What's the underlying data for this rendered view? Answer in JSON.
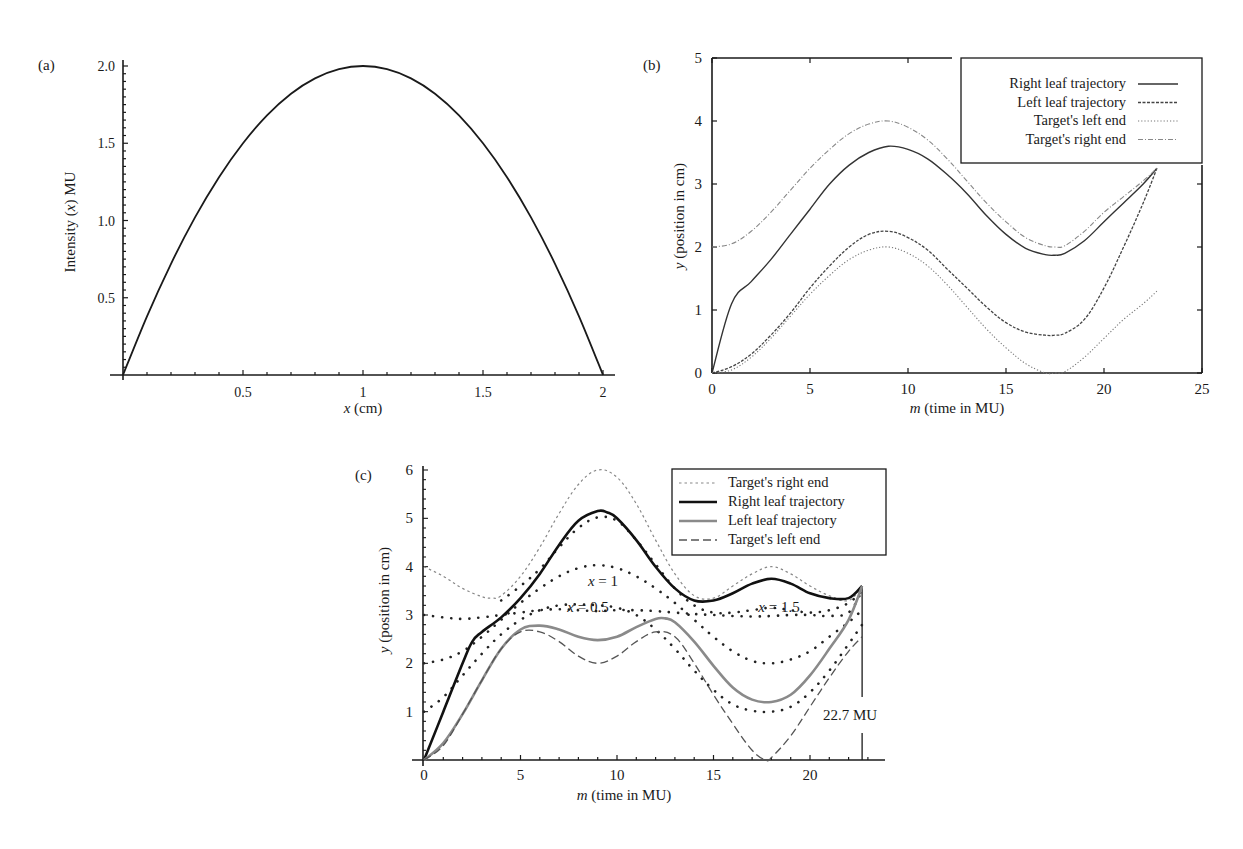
{
  "figure": {
    "panels": [
      "(a)",
      "(b)",
      "(c)"
    ]
  },
  "chart_data": [
    {
      "id": "a",
      "panel_label": "(a)",
      "type": "line",
      "title": "",
      "xlabel": "x (cm)",
      "ylabel": "Intensity (x) MU",
      "xlim": [
        0,
        2
      ],
      "ylim": [
        0,
        2.0
      ],
      "xticks": [
        0.5,
        1,
        1.5,
        2
      ],
      "xtick_labels": [
        "0.5",
        "1",
        "1.5",
        "2"
      ],
      "yticks": [
        0.5,
        1.0,
        1.5,
        2.0
      ],
      "ytick_labels": [
        "0.5",
        "1.0",
        "1.5",
        "2.0"
      ],
      "grid": false,
      "legend": null,
      "series": [
        {
          "name": "Intensity profile",
          "style": "solid",
          "x": [
            0,
            0.1,
            0.2,
            0.3,
            0.4,
            0.5,
            0.6,
            0.7,
            0.8,
            0.9,
            1.0,
            1.1,
            1.2,
            1.3,
            1.4,
            1.5,
            1.6,
            1.7,
            1.8,
            1.9,
            2.0
          ],
          "y": [
            0,
            0.38,
            0.72,
            1.02,
            1.28,
            1.5,
            1.68,
            1.82,
            1.92,
            1.98,
            2.0,
            1.98,
            1.92,
            1.82,
            1.68,
            1.5,
            1.28,
            1.02,
            0.72,
            0.38,
            0
          ]
        }
      ]
    },
    {
      "id": "b",
      "panel_label": "(b)",
      "type": "line",
      "title": "",
      "xlabel": "m (time in MU)",
      "ylabel": "y (position in cm)",
      "xlim": [
        0,
        25
      ],
      "ylim": [
        0,
        5
      ],
      "xticks": [
        0,
        5,
        10,
        15,
        20,
        25
      ],
      "xtick_labels": [
        "0",
        "5",
        "10",
        "15",
        "20",
        "25"
      ],
      "yticks": [
        0,
        1,
        2,
        3,
        4,
        5
      ],
      "ytick_labels": [
        "0",
        "1",
        "2",
        "3",
        "4",
        "5"
      ],
      "grid": false,
      "legend_position": "upper right",
      "series": [
        {
          "name": "Right leaf trajectory",
          "style": "solid",
          "x": [
            0,
            1.0,
            2.0,
            3.0,
            4.0,
            5.0,
            6.0,
            7.0,
            8.0,
            9.0,
            10.0,
            11.0,
            12.0,
            13.0,
            14.0,
            15.0,
            16.0,
            17.0,
            17.5,
            18.0,
            19.0,
            20.0,
            21.0,
            22.0,
            22.7
          ],
          "y": [
            0,
            1.1,
            1.45,
            1.8,
            2.2,
            2.6,
            3.0,
            3.3,
            3.5,
            3.6,
            3.55,
            3.4,
            3.15,
            2.85,
            2.5,
            2.2,
            1.98,
            1.88,
            1.87,
            1.9,
            2.1,
            2.4,
            2.7,
            3.0,
            3.25
          ]
        },
        {
          "name": "Left leaf trajectory",
          "style": "dashed",
          "x": [
            0,
            1.0,
            2.0,
            3.0,
            4.0,
            5.0,
            6.0,
            7.0,
            8.0,
            9.0,
            10.0,
            11.0,
            12.0,
            13.0,
            14.0,
            15.0,
            16.0,
            17.0,
            17.5,
            18.0,
            19.0,
            20.0,
            21.0,
            22.0,
            22.7
          ],
          "y": [
            0,
            0.1,
            0.3,
            0.6,
            0.95,
            1.35,
            1.7,
            2.0,
            2.2,
            2.25,
            2.15,
            1.95,
            1.65,
            1.35,
            1.05,
            0.8,
            0.65,
            0.6,
            0.6,
            0.63,
            0.85,
            1.35,
            2.0,
            2.7,
            3.25
          ]
        },
        {
          "name": "Target's left end",
          "style": "dotted",
          "x": [
            0,
            1.0,
            2.0,
            3.0,
            4.0,
            5.0,
            6.0,
            7.0,
            8.0,
            9.0,
            10.0,
            11.0,
            12.0,
            13.0,
            14.0,
            15.0,
            16.0,
            17.0,
            17.5,
            18.0,
            19.0,
            20.0,
            21.0,
            22.0,
            22.7
          ],
          "y": [
            0,
            0.05,
            0.25,
            0.55,
            0.9,
            1.25,
            1.55,
            1.8,
            1.95,
            2.0,
            1.9,
            1.7,
            1.4,
            1.05,
            0.7,
            0.4,
            0.15,
            0.0,
            0.0,
            0.02,
            0.25,
            0.55,
            0.85,
            1.1,
            1.3
          ]
        },
        {
          "name": "Target's right end",
          "style": "dash-dot",
          "x": [
            0,
            1.0,
            2.0,
            3.0,
            4.0,
            5.0,
            6.0,
            7.0,
            8.0,
            9.0,
            10.0,
            11.0,
            12.0,
            13.0,
            14.0,
            15.0,
            16.0,
            17.0,
            17.5,
            18.0,
            19.0,
            20.0,
            21.0,
            22.0,
            22.7
          ],
          "y": [
            2.0,
            2.05,
            2.25,
            2.55,
            2.9,
            3.25,
            3.55,
            3.8,
            3.95,
            4.0,
            3.9,
            3.7,
            3.4,
            3.05,
            2.7,
            2.4,
            2.15,
            2.02,
            2.0,
            2.02,
            2.25,
            2.55,
            2.8,
            3.05,
            3.25
          ]
        }
      ]
    },
    {
      "id": "c",
      "panel_label": "(c)",
      "type": "line",
      "title": "",
      "xlabel": "m (time in MU)",
      "ylabel": "y (position in cm)",
      "xlim": [
        0,
        23.5
      ],
      "ylim": [
        0,
        6
      ],
      "xticks": [
        0,
        5,
        10,
        15,
        20
      ],
      "xtick_labels": [
        "0",
        "5",
        "10",
        "15",
        "20"
      ],
      "yticks": [
        1,
        2,
        3,
        4,
        5,
        6
      ],
      "ytick_labels": [
        "1",
        "2",
        "3",
        "4",
        "5",
        "6"
      ],
      "grid": false,
      "legend_position": "upper right",
      "annotations": [
        {
          "text": "x = 1",
          "x": 9.0,
          "y": 4.35
        },
        {
          "text": "x = 0.5",
          "x": 9.0,
          "y": 3.2
        },
        {
          "text": "x = 1.5",
          "x": 16.8,
          "y": 3.2
        },
        {
          "text": "22.7 MU",
          "x": 22.7,
          "y": 1.0
        }
      ],
      "marker_line": {
        "x": 22.7,
        "y_from": 0,
        "y_to": 3.6
      },
      "series": [
        {
          "name": "Target's right end",
          "style": "dotted-thin-gray",
          "x": [
            0,
            1,
            2,
            3,
            3.5,
            4,
            5,
            6,
            7,
            8,
            9,
            10,
            11,
            12,
            13,
            14,
            15,
            16,
            17,
            18,
            19,
            20,
            21,
            22,
            22.7
          ],
          "y": [
            4.0,
            3.8,
            3.55,
            3.38,
            3.35,
            3.4,
            3.8,
            4.4,
            5.1,
            5.7,
            6.0,
            5.85,
            5.3,
            4.55,
            3.85,
            3.4,
            3.35,
            3.6,
            3.85,
            4.0,
            3.85,
            3.6,
            3.4,
            3.3,
            3.6
          ]
        },
        {
          "name": "Right leaf trajectory",
          "style": "solid-thick-black",
          "x": [
            0,
            1,
            2,
            2.5,
            3,
            4,
            5,
            6,
            7,
            8,
            9,
            9.5,
            10,
            11,
            12,
            13,
            14,
            15,
            16,
            17,
            18,
            19,
            20,
            21,
            22,
            22.7
          ],
          "y": [
            0,
            1.0,
            2.0,
            2.45,
            2.65,
            2.95,
            3.35,
            3.85,
            4.45,
            4.95,
            5.15,
            5.12,
            5.0,
            4.55,
            4.0,
            3.55,
            3.3,
            3.3,
            3.45,
            3.65,
            3.75,
            3.65,
            3.45,
            3.35,
            3.35,
            3.6
          ]
        },
        {
          "name": "Left leaf trajectory",
          "style": "solid-thick-gray",
          "x": [
            0,
            1,
            2,
            3,
            4,
            5,
            6,
            7,
            8,
            9,
            10,
            11,
            12,
            12.5,
            13,
            14,
            15,
            16,
            17,
            18,
            19,
            20,
            21,
            22,
            22.7
          ],
          "y": [
            0,
            0.35,
            0.95,
            1.65,
            2.3,
            2.7,
            2.78,
            2.7,
            2.55,
            2.48,
            2.55,
            2.75,
            2.92,
            2.93,
            2.85,
            2.45,
            1.95,
            1.5,
            1.25,
            1.2,
            1.35,
            1.75,
            2.3,
            2.9,
            3.6
          ]
        },
        {
          "name": "Target's left end",
          "style": "dashed-gray",
          "x": [
            0,
            1,
            2,
            3,
            4,
            5,
            6,
            7,
            8,
            9,
            10,
            11,
            12,
            13,
            14,
            15,
            16,
            17,
            17.7,
            18,
            19,
            20,
            21,
            22,
            22.7
          ],
          "y": [
            0,
            0.3,
            0.95,
            1.65,
            2.3,
            2.65,
            2.65,
            2.45,
            2.15,
            2.0,
            2.15,
            2.45,
            2.65,
            2.55,
            2.0,
            1.35,
            0.75,
            0.2,
            0.0,
            0.05,
            0.5,
            1.1,
            1.7,
            2.25,
            2.55
          ]
        },
        {
          "name": "x = 0.5 profile",
          "style": "dots",
          "x": [
            0,
            1,
            2,
            3,
            4,
            5,
            6,
            7,
            8,
            9,
            10,
            11,
            12,
            13,
            14,
            15,
            16,
            17,
            18,
            19,
            20,
            21,
            22,
            22.7
          ],
          "y": [
            1.0,
            1.3,
            1.75,
            2.2,
            2.6,
            2.9,
            3.1,
            3.2,
            3.22,
            3.2,
            3.15,
            3.0,
            2.7,
            2.3,
            1.85,
            1.45,
            1.15,
            1.02,
            1.0,
            1.1,
            1.4,
            1.85,
            2.4,
            2.8
          ]
        },
        {
          "name": "x = 1 profile",
          "style": "dots",
          "x": [
            0,
            1,
            2,
            3,
            4,
            5,
            6,
            7,
            8,
            9,
            10,
            11,
            12,
            13,
            14,
            15,
            16,
            17,
            18,
            19,
            20,
            21,
            22,
            22.7
          ],
          "y": [
            2.0,
            2.08,
            2.25,
            2.55,
            2.9,
            3.25,
            3.55,
            3.8,
            3.97,
            4.03,
            3.97,
            3.8,
            3.55,
            3.25,
            2.9,
            2.55,
            2.25,
            2.05,
            2.0,
            2.08,
            2.25,
            2.55,
            2.85,
            3.1
          ]
        },
        {
          "name": "x = 1.5 profile",
          "style": "dots",
          "x": [
            0,
            1,
            2,
            3,
            4,
            5,
            6,
            7,
            8,
            9,
            10,
            11,
            12,
            13,
            14,
            15,
            16,
            17,
            18,
            19,
            20,
            21,
            22,
            22.7
          ],
          "y": [
            3.0,
            2.95,
            2.92,
            2.95,
            3.0,
            3.05,
            3.1,
            3.12,
            3.1,
            3.08,
            3.1,
            3.1,
            3.08,
            3.05,
            3.02,
            3.0,
            2.98,
            2.97,
            2.98,
            3.0,
            3.0,
            2.98,
            3.05,
            3.5
          ]
        },
        {
          "name": "x = 1.5 upper profile",
          "style": "dots",
          "x": [
            4,
            5,
            6,
            7,
            8,
            9,
            10,
            11,
            12,
            13,
            14,
            15,
            16,
            17,
            18,
            19,
            20,
            21,
            22,
            22.7
          ],
          "y": [
            3.3,
            3.6,
            3.95,
            4.4,
            4.8,
            5.02,
            4.95,
            4.55,
            4.05,
            3.55,
            3.2,
            3.05,
            3.05,
            3.1,
            3.15,
            3.1,
            3.05,
            3.1,
            3.25,
            3.5
          ]
        }
      ]
    }
  ]
}
